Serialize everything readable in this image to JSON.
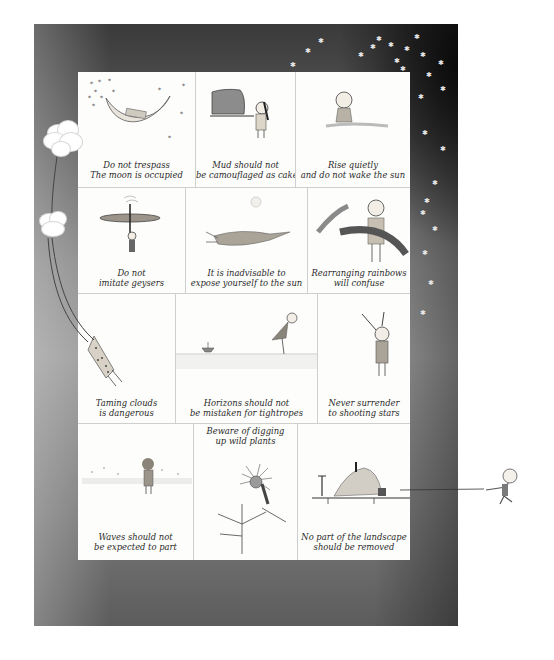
{
  "artwork": {
    "frame_color_dark": "#1a1a1a",
    "frame_color_light": "#9a9a9a",
    "panel_background": "#fdfdfb",
    "caption_color": "#2a2a2a"
  },
  "panels": [
    {
      "id": "moon",
      "lines": [
        "Do not trespass",
        "The moon is occupied"
      ],
      "illustration": "crescent-moon-with-sleeping-figure"
    },
    {
      "id": "mud",
      "lines": [
        "Mud should not",
        "be camouflaged as cake"
      ],
      "illustration": "girl-holding-mud-cake"
    },
    {
      "id": "sun",
      "lines": [
        "Rise quietly",
        "and do not wake the sun"
      ],
      "illustration": "child-rising-from-ground"
    },
    {
      "id": "geyser",
      "lines": [
        "Do not",
        "imitate geysers"
      ],
      "illustration": "figure-under-disc-with-steam"
    },
    {
      "id": "expose",
      "lines": [
        "It is inadvisable to",
        "expose yourself to the sun"
      ],
      "illustration": "figure-lying-under-sun"
    },
    {
      "id": "rainbow",
      "lines": [
        "Rearranging rainbows",
        "will confuse"
      ],
      "illustration": "child-carrying-rainbow"
    },
    {
      "id": "clouds",
      "lines": [
        "Taming clouds",
        "is dangerous"
      ],
      "illustration": "figure-hanging-from-cloud-string"
    },
    {
      "id": "horizon",
      "lines": [
        "Horizons should not",
        "be mistaken for tightropes"
      ],
      "illustration": "girl-walking-on-horizon-with-boat"
    },
    {
      "id": "stars",
      "lines": [
        "Never surrender",
        "to shooting stars"
      ],
      "illustration": "child-reaching-up"
    },
    {
      "id": "waves",
      "lines": [
        "Waves should not",
        "be expected to part"
      ],
      "illustration": "child-facing-sea"
    },
    {
      "id": "plants",
      "lines": [
        "Beware of digging",
        "up wild plants"
      ],
      "illustration": "figure-in-giant-flower"
    },
    {
      "id": "landscape",
      "lines": [
        "No part of the landscape",
        "should be removed"
      ],
      "illustration": "landscape-piece-pulled-by-rope"
    }
  ]
}
